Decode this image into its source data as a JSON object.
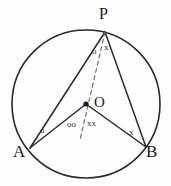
{
  "figure": {
    "kind": "circle-geometry-diagram",
    "background_color": "#fefefe",
    "stroke_color": "#2b2b2b",
    "dash_color": "#6e6e6e"
  },
  "labels": {
    "p": "P",
    "o": "O",
    "a": "A",
    "b": "B"
  },
  "angle_marks": {
    "at_p_left": "o",
    "at_p_right": "x",
    "at_a": "o",
    "at_o_left": "oo",
    "at_o_right": "xx",
    "at_b": "x"
  },
  "geometry": {
    "circle": {
      "cx": 86,
      "cy": 104,
      "r": 74
    },
    "points": {
      "P": {
        "x": 105,
        "y": 32
      },
      "O": {
        "x": 86,
        "y": 104
      },
      "A": {
        "x": 30,
        "y": 148
      },
      "B": {
        "x": 146,
        "y": 147
      }
    },
    "segments": [
      {
        "name": "PA",
        "from": "P",
        "to": "A",
        "style": "solid"
      },
      {
        "name": "PB",
        "from": "P",
        "to": "B",
        "style": "solid"
      },
      {
        "name": "OA",
        "from": "O",
        "to": "A",
        "style": "solid"
      },
      {
        "name": "OB",
        "from": "O",
        "to": "B",
        "style": "solid"
      },
      {
        "name": "PO-extended",
        "from": "P",
        "to": "below-O",
        "style": "dashed"
      }
    ],
    "center_dot_radius": 2.4
  }
}
